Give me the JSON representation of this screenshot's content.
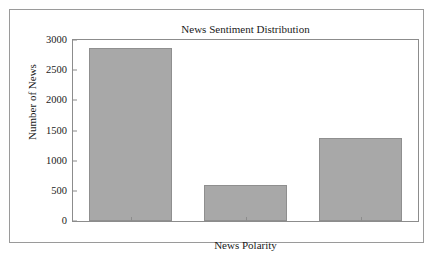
{
  "chart_data": {
    "type": "bar",
    "title": "News Sentiment Distribution",
    "xlabel": "News Polarity",
    "ylabel": "Number of News",
    "categories": [
      "neutral",
      "negative",
      "positive"
    ],
    "values": [
      2870,
      600,
      1380
    ],
    "ylim": [
      0,
      3000
    ],
    "yticks": [
      0,
      500,
      1000,
      1500,
      2000,
      2500,
      3000
    ],
    "ytick_labels": [
      "0",
      "500",
      "1000",
      "1500",
      "2000",
      "2500",
      "3000"
    ],
    "grid": false,
    "legend": false,
    "bar_color": "#a8a8a8",
    "bar_edge_color": "#8f8f8f",
    "axes_color": "#8c8c8c",
    "background_color": "#ffffff"
  }
}
